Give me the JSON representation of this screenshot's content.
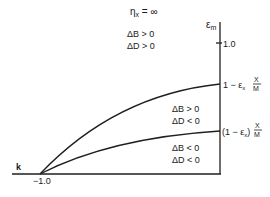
{
  "title": "η",
  "title_sub": "x",
  "title_rest": " = ∞",
  "y_axis_label": "ε",
  "y_axis_label_sub": "m",
  "x_axis_label": "k",
  "x_tick_label": "−1.0",
  "y_tick_label": "1.0",
  "upper_curve_label": {
    "prefix": "1 − ε",
    "sub": "x",
    "num": "X",
    "den": "M"
  },
  "lower_curve_label": {
    "prefix": "(1 − ε",
    "sub": "x",
    "suffix": ")",
    "num": "X",
    "den": "M"
  },
  "regions": [
    {
      "line1": "ΔB > 0",
      "line2": "ΔD > 0"
    },
    {
      "line1": "ΔB > 0",
      "line2": "ΔD < 0"
    },
    {
      "line1": "ΔB < 0",
      "line2": "ΔD < 0"
    }
  ]
}
